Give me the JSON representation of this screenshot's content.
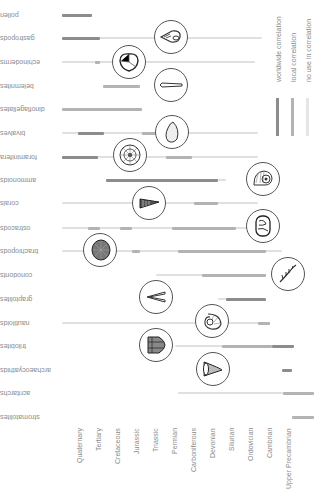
{
  "chart_data": {
    "type": "range-bar",
    "title": "",
    "orientation_note": "image rotated 180 degrees",
    "xlabel": "geological period",
    "categories_periods": [
      "Upper Precambrian",
      "Cambrian",
      "Ordovician",
      "Silurian",
      "Devonian",
      "Carboniferous",
      "Permian",
      "Triassic",
      "Jurassic",
      "Cretaceous",
      "Tertiary",
      "Quaternary"
    ],
    "legend": [
      {
        "key": "worldwide",
        "label": "worldwide correlation",
        "color": "#8c8c8c"
      },
      {
        "key": "local",
        "label": "local correlation",
        "color": "#b3b3b3"
      },
      {
        "key": "none",
        "label": "no use in correlation",
        "color": "#e0e0e0"
      }
    ],
    "taxa": [
      {
        "name": "pollen",
        "y": 15,
        "bars": [
          {
            "x1": 62,
            "x2": 92,
            "type": "worldwide"
          }
        ]
      },
      {
        "name": "gastropods",
        "y": 38,
        "bars": [
          {
            "x1": 62,
            "x2": 100,
            "type": "worldwide"
          },
          {
            "x1": 100,
            "x2": 262,
            "type": "none"
          }
        ]
      },
      {
        "name": "echinoderms",
        "y": 62,
        "bars": [
          {
            "x1": 62,
            "x2": 255,
            "type": "none"
          },
          {
            "x1": 95,
            "x2": 100,
            "type": "local"
          }
        ]
      },
      {
        "name": "belemnites",
        "y": 86,
        "bars": [
          {
            "x1": 103,
            "x2": 140,
            "type": "local"
          }
        ]
      },
      {
        "name": "dinoflagellates",
        "y": 109,
        "bars": [
          {
            "x1": 62,
            "x2": 142,
            "type": "local"
          }
        ]
      },
      {
        "name": "bivalves",
        "y": 133,
        "bars": [
          {
            "x1": 62,
            "x2": 258,
            "type": "none"
          },
          {
            "x1": 78,
            "x2": 104,
            "type": "worldwide"
          },
          {
            "x1": 142,
            "x2": 158,
            "type": "local"
          }
        ]
      },
      {
        "name": "foraminifera",
        "y": 157,
        "bars": [
          {
            "x1": 62,
            "x2": 258,
            "type": "none"
          },
          {
            "x1": 62,
            "x2": 98,
            "type": "worldwide"
          },
          {
            "x1": 166,
            "x2": 192,
            "type": "local"
          }
        ]
      },
      {
        "name": "ammonoids",
        "y": 180,
        "bars": [
          {
            "x1": 106,
            "x2": 218,
            "type": "worldwide"
          },
          {
            "x1": 218,
            "x2": 226,
            "type": "none"
          }
        ]
      },
      {
        "name": "corals",
        "y": 203,
        "bars": [
          {
            "x1": 62,
            "x2": 258,
            "type": "none"
          },
          {
            "x1": 194,
            "x2": 218,
            "type": "local"
          }
        ]
      },
      {
        "name": "ostracods",
        "y": 228,
        "bars": [
          {
            "x1": 62,
            "x2": 258,
            "type": "none"
          },
          {
            "x1": 88,
            "x2": 100,
            "type": "local"
          },
          {
            "x1": 120,
            "x2": 132,
            "type": "local"
          },
          {
            "x1": 172,
            "x2": 236,
            "type": "local"
          }
        ]
      },
      {
        "name": "brachiopods",
        "y": 251,
        "bars": [
          {
            "x1": 62,
            "x2": 282,
            "type": "none"
          },
          {
            "x1": 132,
            "x2": 140,
            "type": "local"
          },
          {
            "x1": 178,
            "x2": 266,
            "type": "local"
          }
        ]
      },
      {
        "name": "conodonts",
        "y": 275,
        "bars": [
          {
            "x1": 156,
            "x2": 266,
            "type": "none"
          },
          {
            "x1": 202,
            "x2": 266,
            "type": "local"
          }
        ]
      },
      {
        "name": "graptolites",
        "y": 299,
        "bars": [
          {
            "x1": 218,
            "x2": 226,
            "type": "none"
          },
          {
            "x1": 226,
            "x2": 266,
            "type": "worldwide"
          }
        ]
      },
      {
        "name": "nautiloids",
        "y": 323,
        "bars": [
          {
            "x1": 62,
            "x2": 266,
            "type": "none"
          },
          {
            "x1": 258,
            "x2": 270,
            "type": "local"
          }
        ]
      },
      {
        "name": "trilobites",
        "y": 346,
        "bars": [
          {
            "x1": 175,
            "x2": 294,
            "type": "none"
          },
          {
            "x1": 222,
            "x2": 272,
            "type": "local"
          },
          {
            "x1": 272,
            "x2": 294,
            "type": "worldwide"
          }
        ]
      },
      {
        "name": "archaeocyathids",
        "y": 370,
        "bars": [
          {
            "x1": 282,
            "x2": 292,
            "type": "worldwide"
          }
        ]
      },
      {
        "name": "acritarchs",
        "y": 393,
        "bars": [
          {
            "x1": 178,
            "x2": 283,
            "type": "none"
          },
          {
            "x1": 283,
            "x2": 314,
            "type": "local"
          }
        ]
      },
      {
        "name": "stromatolites",
        "y": 417,
        "bars": [
          {
            "x1": 292,
            "x2": 314,
            "type": "local"
          }
        ]
      }
    ]
  },
  "periods": [
    {
      "label": "Quaternary",
      "x": 76
    },
    {
      "label": "Tertiary",
      "x": 95
    },
    {
      "label": "Cretaceous",
      "x": 114
    },
    {
      "label": "Jurassic",
      "x": 133
    },
    {
      "label": "Triassic",
      "x": 152
    },
    {
      "label": "Permian",
      "x": 171
    },
    {
      "label": "Carboniferous",
      "x": 190
    },
    {
      "label": "Devonian",
      "x": 209
    },
    {
      "label": "Silurian",
      "x": 228
    },
    {
      "label": "Ordovician",
      "x": 247
    },
    {
      "label": "Cambrian",
      "x": 266
    },
    {
      "label": "Upper Precambrian",
      "x": 285
    }
  ],
  "legend": {
    "worldwide": "worldwide correlation",
    "local": "local correlation",
    "none": "no use in correlation"
  }
}
